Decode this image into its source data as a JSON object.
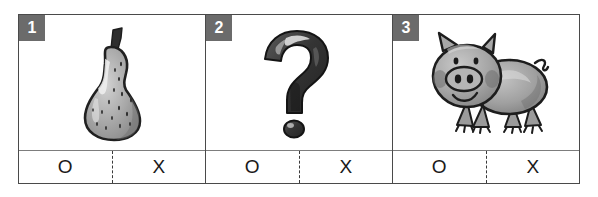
{
  "worksheet": {
    "title": "Picture identification answer sheet",
    "panels": [
      {
        "number": "1",
        "figure_name": "pear-illustration",
        "figure_label": "pear",
        "options": [
          {
            "label": "O",
            "name": "option-circle"
          },
          {
            "label": "X",
            "name": "option-cross"
          }
        ]
      },
      {
        "number": "2",
        "figure_name": "question-mark-illustration",
        "figure_label": "question mark",
        "options": [
          {
            "label": "O",
            "name": "option-circle"
          },
          {
            "label": "X",
            "name": "option-cross"
          }
        ]
      },
      {
        "number": "3",
        "figure_name": "pig-illustration",
        "figure_label": "pig",
        "options": [
          {
            "label": "O",
            "name": "option-circle"
          },
          {
            "label": "X",
            "name": "option-cross"
          }
        ]
      }
    ],
    "colors": {
      "frame": "#4a4a4a",
      "badge_background": "#6b6b6b",
      "badge_text": "#ffffff",
      "answer_divider": "#7d7d7d",
      "page_background": "#ffffff",
      "art_dark": "#2b2b2b",
      "art_mid": "#8d8d8d",
      "art_light": "#c9c9c9"
    }
  }
}
